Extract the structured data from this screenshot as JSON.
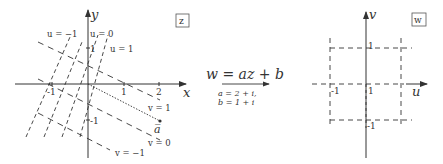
{
  "left_plot": {
    "plane_label": "z",
    "x_axis_label": "x",
    "y_axis_label": "y",
    "x_ticks": [
      "-1",
      "1",
      "2"
    ],
    "y_ticks": [
      "1",
      "-1"
    ],
    "u_lines": [
      "u = −1",
      "u = 0",
      "u = 1"
    ],
    "v_lines": [
      "v = 1",
      "v = 0",
      "v = −1"
    ],
    "point_label": "a̅"
  },
  "mapping": {
    "formula": "w = az + b",
    "param_a": "a = 2 + i,",
    "param_b": "b = 1 + i"
  },
  "right_plot": {
    "plane_label": "w",
    "u_axis_label": "u",
    "v_axis_label": "v",
    "ticks": {
      "v_top": "1",
      "u_left": "-1",
      "origin": "1",
      "v_bottom": "-1"
    }
  }
}
